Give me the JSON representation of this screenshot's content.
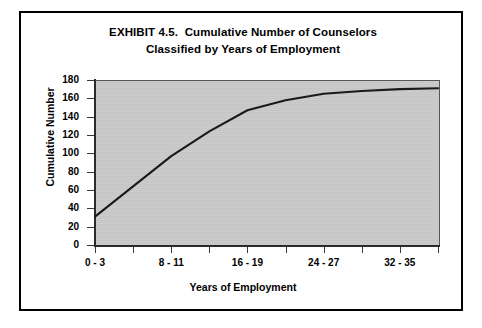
{
  "figure": {
    "title_line_1": "EXHIBIT 4.5.  Cumulative Number of Counselors",
    "title_line_2": "Classified by Years of Employment",
    "plot_background_color": "#c9c9c9",
    "line_color": "#1a1a1a",
    "border_color": "#000000"
  },
  "chart_data": {
    "type": "line",
    "title": "EXHIBIT 4.5.  Cumulative Number of Counselors Classified by Years of Employment",
    "xlabel": "Years of Employment",
    "ylabel": "Cumulative Number",
    "grid": false,
    "legend": null,
    "ylim": [
      0,
      180
    ],
    "yticks": [
      0,
      20,
      40,
      60,
      80,
      100,
      120,
      140,
      160,
      180
    ],
    "ytick_labels": [
      "0",
      "20",
      "40",
      "60",
      "80",
      "100",
      "120",
      "140",
      "160",
      "180"
    ],
    "x_categories": [
      "0 - 3",
      "4 - 7",
      "8 - 11",
      "12 - 15",
      "16 - 19",
      "20 - 23",
      "24 - 27",
      "28 - 31",
      "32 - 35",
      "36 - 39"
    ],
    "xtick_labels_shown": [
      "0 - 3",
      "8 - 11",
      "16 - 19",
      "24 - 27",
      "32 - 35"
    ],
    "xtick_labels_shown_indices": [
      0,
      2,
      4,
      6,
      8
    ],
    "series": [
      {
        "name": "Cumulative Number of Counselors",
        "values": [
          31,
          64,
          97,
          124,
          147,
          158,
          165,
          168,
          170,
          171
        ]
      }
    ]
  }
}
